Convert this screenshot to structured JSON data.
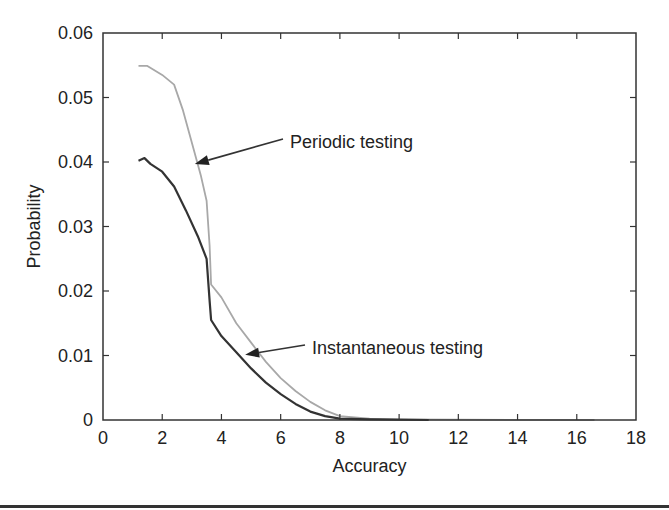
{
  "chart_data": {
    "type": "line",
    "title": "",
    "xlabel": "Accuracy",
    "ylabel": "Probability",
    "xlim": [
      0,
      18
    ],
    "ylim": [
      0,
      0.06
    ],
    "xticks": [
      0,
      2,
      4,
      6,
      8,
      10,
      12,
      14,
      16,
      18
    ],
    "xtick_labels": [
      "0",
      "2",
      "4",
      "6",
      "8",
      "10",
      "12",
      "14",
      "16",
      "18"
    ],
    "yticks": [
      0,
      0.01,
      0.02,
      0.03,
      0.04,
      0.05,
      0.06
    ],
    "ytick_labels": [
      "0",
      "0.01",
      "0.02",
      "0.03",
      "0.04",
      "0.05",
      "0.06"
    ],
    "grid": false,
    "legend": "none (inline arrow annotations)",
    "series": [
      {
        "name": "Periodic testing",
        "color": "#a8a8a8",
        "x": [
          1.2,
          1.5,
          2.0,
          2.4,
          2.7,
          3.0,
          3.3,
          3.5,
          3.6,
          3.65,
          4.0,
          4.5,
          5.0,
          5.5,
          6.0,
          6.5,
          7.0,
          7.5,
          8.0,
          9.0,
          10.0,
          12.0,
          16.6
        ],
        "y": [
          0.0549,
          0.0549,
          0.0535,
          0.052,
          0.048,
          0.043,
          0.038,
          0.034,
          0.027,
          0.021,
          0.019,
          0.015,
          0.012,
          0.009,
          0.0065,
          0.0045,
          0.0028,
          0.0015,
          0.0006,
          0.0002,
          0.0001,
          5e-05,
          0.0
        ]
      },
      {
        "name": "Instantaneous testing",
        "color": "#333333",
        "x": [
          1.2,
          1.4,
          1.6,
          2.0,
          2.4,
          2.8,
          3.2,
          3.5,
          3.6,
          3.65,
          4.0,
          4.5,
          5.0,
          5.5,
          6.0,
          6.5,
          7.0,
          7.5,
          8.0,
          9.0,
          11.0
        ],
        "y": [
          0.0402,
          0.0406,
          0.0397,
          0.0385,
          0.0362,
          0.0325,
          0.0285,
          0.025,
          0.0185,
          0.0155,
          0.013,
          0.0105,
          0.008,
          0.0058,
          0.004,
          0.0025,
          0.0013,
          0.0006,
          0.0002,
          0.0001,
          0.0
        ]
      }
    ],
    "annotations": [
      {
        "text": "Periodic testing",
        "arrow_to": [
          3.1,
          0.0397
        ]
      },
      {
        "text": "Instantaneous testing",
        "arrow_to": [
          4.8,
          0.0101
        ]
      }
    ]
  },
  "plot": {
    "left": 103,
    "top": 33,
    "right": 636,
    "bottom": 420,
    "annotation_labels": {
      "periodic": "Periodic testing",
      "instantaneous": "Instantaneous testing"
    }
  }
}
